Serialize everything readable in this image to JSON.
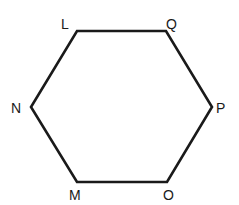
{
  "diagram": {
    "type": "hexagon",
    "stroke_color": "#1a1a1a",
    "background": "#ffffff",
    "vertices": [
      {
        "name": "L",
        "label": "L",
        "x": 77,
        "y": 31,
        "lx": 61,
        "ly": 29
      },
      {
        "name": "Q",
        "label": "Q",
        "x": 166,
        "y": 31,
        "lx": 166,
        "ly": 29
      },
      {
        "name": "P",
        "label": "P",
        "x": 212,
        "y": 107,
        "lx": 216,
        "ly": 113
      },
      {
        "name": "O",
        "label": "O",
        "x": 167,
        "y": 182,
        "lx": 163,
        "ly": 200
      },
      {
        "name": "M",
        "label": "M",
        "x": 77,
        "y": 182,
        "lx": 69,
        "ly": 200
      },
      {
        "name": "N",
        "label": "N",
        "x": 31,
        "y": 107,
        "lx": 11,
        "ly": 113
      }
    ],
    "labels": {
      "L": "L",
      "Q": "Q",
      "P": "P",
      "O": "O",
      "M": "M",
      "N": "N"
    }
  }
}
